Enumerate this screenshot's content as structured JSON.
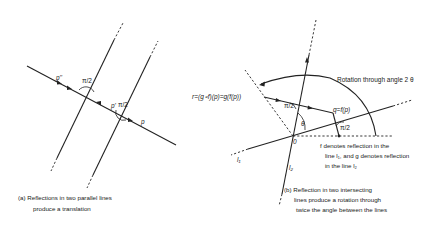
{
  "figure": {
    "panel_a": {
      "caption_line1": "(a)  Reflections in two parallel lines",
      "caption_line2": "produce a translation",
      "labels": {
        "p_double_prime": "p''",
        "p_prime": "p'",
        "p": "p",
        "right_angle_1": "π/2",
        "right_angle_2": "π/2"
      }
    },
    "panel_b": {
      "caption_line1": "(b) Reflection in two intersecting",
      "caption_line2": "lines produce a rotation through",
      "caption_line3": "twice the angle between the lines",
      "rotation_label": "Rotation through angle 2 θ",
      "r_label": "r=(g∘f)(p)=g(f(p))",
      "q_label": "q=f(p)",
      "origin_label": "0",
      "theta_label": "θ",
      "right_angle_1": "π/2",
      "right_angle_2": "π/2",
      "line1_label": "l₁",
      "line2_label": "l₂",
      "note_line1": "f  denotes reflection in the",
      "note_line2": "line l₁, and g denotes reflection",
      "note_line3": "in the line l₂"
    }
  }
}
